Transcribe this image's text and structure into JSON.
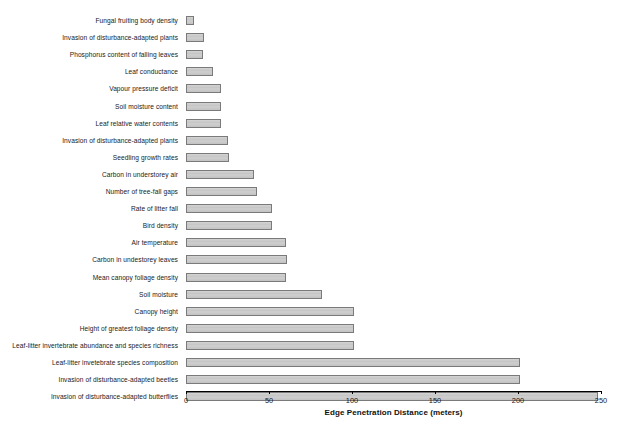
{
  "chart_data": {
    "type": "bar",
    "orientation": "horizontal",
    "title": "",
    "xlabel": "Edge Penetration Distance (meters)",
    "ylabel": "",
    "xlim": [
      0,
      250
    ],
    "xticks": [
      0,
      50,
      100,
      150,
      200,
      250
    ],
    "xtick_labels": [
      "0",
      "50",
      "100",
      "150",
      "200",
      "250"
    ],
    "grid": false,
    "legend": false,
    "bar_fill_color": "#c9c9c9",
    "bar_border_color": "#7a7a7a",
    "categories": [
      "Fungal fruiting body density",
      "Invasion of disturbance-adapted plants",
      "Phosphorus content of falling leaves",
      "Leaf conductance",
      "Vapour pressure deficit",
      "Soil moisture content",
      "Leaf relative water contents",
      "Invasion of disturbance-adapted plants",
      "Seedling growth rates",
      "Carbon in understorey air",
      "Number of tree-fall gaps",
      "Rate of litter fall",
      "Bird density",
      "Air temperature",
      "Carbon in undestorey leaves",
      "Mean canopy foliage density",
      "Soil moisture",
      "Canopy height",
      "Height of greatest foliage density",
      "Leaf-litter invertebrate abundance and species richness",
      "Leaf-litter invetebrate species composition",
      "Invasion of disturbance-adapted beetles",
      "Invasion of disturbance-adapted butterflies"
    ],
    "values": [
      5,
      11,
      10,
      16,
      21,
      21,
      21,
      25,
      26,
      41,
      43,
      52,
      52,
      60,
      61,
      60,
      82,
      101,
      101,
      101,
      201,
      201,
      248
    ]
  }
}
